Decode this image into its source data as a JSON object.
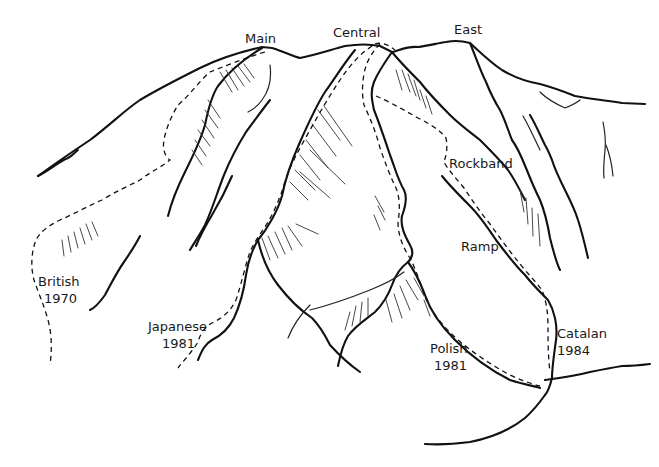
{
  "diagram": {
    "type": "mountain-face-route-topo",
    "summits": [
      {
        "label": "Main"
      },
      {
        "label": "Central"
      },
      {
        "label": "East"
      }
    ],
    "features": [
      {
        "label": "Rockband"
      },
      {
        "label": "Ramp"
      }
    ],
    "routes": [
      {
        "name": "British",
        "year": "1970"
      },
      {
        "name": "Japanese",
        "year": "1981"
      },
      {
        "name": "Polish",
        "year": "1981"
      },
      {
        "name": "Catalan",
        "year": "1984"
      }
    ],
    "colors": {
      "ink": "#111111",
      "background": "#ffffff"
    },
    "legend": {
      "dashed_line": "climbing route"
    }
  }
}
